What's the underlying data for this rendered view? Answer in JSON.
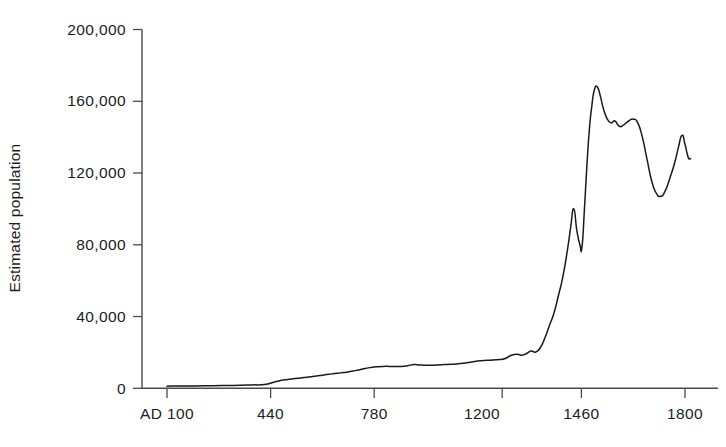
{
  "chart_data": {
    "type": "line",
    "title": "",
    "subtitle": "",
    "xlabel": "",
    "ylabel": "Estimated population",
    "xlim": [
      100,
      1820
    ],
    "ylim": [
      0,
      200000
    ],
    "grid": false,
    "legend": null,
    "axis_origin_label": "AD 100",
    "y_ticks": [
      0,
      40000,
      80000,
      120000,
      160000,
      200000
    ],
    "y_tick_labels": [
      "0",
      "40,000",
      "80,000",
      "120,000",
      "160,000",
      "200,000"
    ],
    "x_ticks": [
      100,
      440,
      780,
      1200,
      1460,
      1800
    ],
    "x_tick_labels": [
      "AD 100",
      "440",
      "780",
      "1200",
      "1460",
      "1800"
    ],
    "series": [
      {
        "name": "Estimated population",
        "color": "#1a1a1a",
        "x": [
          100,
          160,
          220,
          280,
          340,
          380,
          420,
          450,
          470,
          490,
          510,
          530,
          550,
          570,
          590,
          610,
          630,
          650,
          670,
          690,
          710,
          730,
          750,
          770,
          790,
          810,
          830,
          850,
          870,
          890,
          910,
          930,
          950,
          970,
          990,
          1010,
          1030,
          1050,
          1070,
          1090,
          1110,
          1130,
          1150,
          1170,
          1190,
          1210,
          1230,
          1250,
          1265,
          1280,
          1295,
          1310,
          1325,
          1340,
          1355,
          1370,
          1385,
          1400,
          1415,
          1425,
          1435,
          1445,
          1455,
          1462,
          1470,
          1478,
          1486,
          1494,
          1502,
          1512,
          1522,
          1532,
          1545,
          1558,
          1570,
          1585,
          1600,
          1615,
          1630,
          1645,
          1660,
          1675,
          1690,
          1705,
          1720,
          1735,
          1750,
          1765,
          1778,
          1790,
          1800,
          1810,
          1818
        ],
        "values": [
          1200,
          1300,
          1400,
          1500,
          1700,
          1900,
          2100,
          3400,
          4200,
          4800,
          5200,
          5600,
          6000,
          6400,
          6800,
          7300,
          7800,
          8200,
          8600,
          9000,
          9600,
          10200,
          11000,
          11600,
          12000,
          12200,
          12200,
          12100,
          12200,
          12600,
          13200,
          13000,
          12900,
          12900,
          13000,
          13200,
          13400,
          13600,
          14000,
          14400,
          15000,
          15400,
          15600,
          15800,
          16000,
          16600,
          18400,
          19000,
          18400,
          19400,
          20800,
          20200,
          22600,
          28000,
          35000,
          42000,
          52000,
          63000,
          78000,
          90000,
          100000,
          88000,
          80000,
          79000,
          100000,
          124000,
          144000,
          157000,
          166000,
          168000,
          163000,
          156000,
          150000,
          148000,
          149000,
          146000,
          147000,
          149000,
          150000,
          148000,
          140000,
          128000,
          116000,
          109000,
          107000,
          110000,
          117000,
          125000,
          134000,
          141000,
          136000,
          129000,
          128000
        ]
      }
    ]
  },
  "axis": {
    "y_label": "Estimated population"
  }
}
